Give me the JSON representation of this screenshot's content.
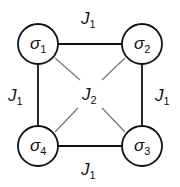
{
  "diagram": {
    "title": "",
    "colors": {
      "edge_nn": "#111111",
      "edge_diag": "#777777",
      "node_stroke": "#111111",
      "node_fill": "#ffffff",
      "text": "#111111"
    },
    "nodes": [
      {
        "id": "s1",
        "symbol": "σ",
        "index": "1"
      },
      {
        "id": "s2",
        "symbol": "σ",
        "index": "2"
      },
      {
        "id": "s3",
        "symbol": "σ",
        "index": "3"
      },
      {
        "id": "s4",
        "symbol": "σ",
        "index": "4"
      }
    ],
    "edges": {
      "top": {
        "from": "s1",
        "to": "s2",
        "symbol": "J",
        "index": "1"
      },
      "right": {
        "from": "s2",
        "to": "s3",
        "symbol": "J",
        "index": "1"
      },
      "bottom": {
        "from": "s4",
        "to": "s3",
        "symbol": "J",
        "index": "1"
      },
      "left": {
        "from": "s1",
        "to": "s4",
        "symbol": "J",
        "index": "1"
      },
      "diag": {
        "symbol": "J",
        "index": "2"
      }
    }
  }
}
